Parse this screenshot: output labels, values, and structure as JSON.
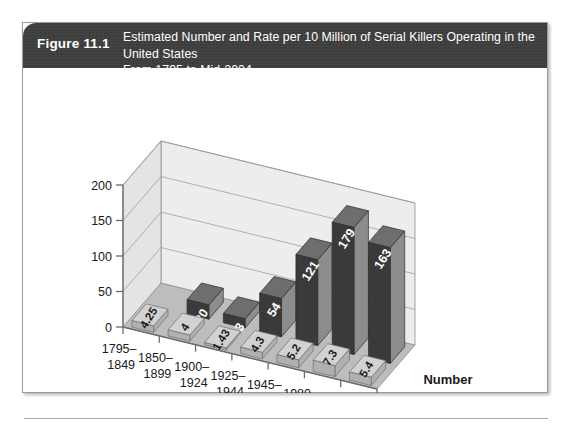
{
  "clipped_top_text": "United States From 1795 to Mid-2004",
  "figure": {
    "number_label": "Figure 11.1",
    "title_line1": "Estimated Number and Rate per 10 Million of Serial Killers Operating in the United States",
    "title_line2": "From 1795 to Mid-2004"
  },
  "colors": {
    "header_bg": "#3d3d3d",
    "header_text": "#ffffff",
    "number_bar_front": "#3a3a3a",
    "number_bar_side": "#8c8c8c",
    "number_bar_top": "#6e6e6e",
    "rate_bar_top": "#d2d2d2",
    "rate_bar_side": "#b0b0b0",
    "floor": "#bdbdbd",
    "wall_left": "#e4e4e4",
    "wall_back": "#ededed",
    "axis_line": "#6b6b6b",
    "grid_line": "#9e9e9e",
    "label_text": "#1a1a1a",
    "bar_label_text": "#ffffff"
  },
  "chart_data": {
    "type": "bar",
    "title": "Estimated Number and Rate per 10 Million of Serial Killers Operating in the United States From 1795 to Mid-2004",
    "xlabel": "",
    "ylabel": "",
    "ylim": [
      0,
      200
    ],
    "yticks": [
      0,
      50,
      100,
      150,
      200
    ],
    "ytick_labels": [
      "0",
      "50",
      "100",
      "150",
      "200"
    ],
    "grid": true,
    "legend_position": "right",
    "projection": "3d",
    "categories": [
      "1795–1849",
      "1850–1899",
      "1900–1924",
      "1925–1944",
      "1945–1979",
      "1980–1989",
      "1990–2004"
    ],
    "category_lines": [
      [
        "1795–",
        "1849"
      ],
      [
        "1850–",
        "1899"
      ],
      [
        "1900–",
        "1924"
      ],
      [
        "1925–",
        "1944"
      ],
      [
        "1945–",
        "1979"
      ],
      [
        "1980–",
        "1989"
      ],
      [
        "1990–",
        "2004"
      ]
    ],
    "series": [
      {
        "name": "Number",
        "values": [
          5,
          20,
          13,
          54,
          121,
          179,
          163
        ],
        "value_labels": [
          "5",
          "20",
          "13",
          "54",
          "121",
          "179",
          "163"
        ],
        "note": "first category has no Number bar shown",
        "visible_from_index": 1
      },
      {
        "name": "Rate",
        "values": [
          4.25,
          4,
          1.43,
          4.3,
          5.2,
          7.3,
          5.4
        ],
        "value_labels": [
          "4.25",
          "4",
          "1.43",
          "4.3",
          "5.2",
          "7.3",
          "5.4"
        ]
      }
    ]
  },
  "legend": {
    "items": [
      {
        "label": "Number"
      },
      {
        "label": "Rate"
      }
    ]
  }
}
